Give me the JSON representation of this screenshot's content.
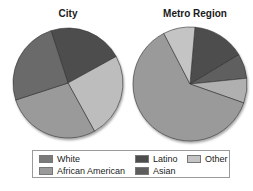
{
  "chart_data": [
    {
      "type": "pie",
      "title": "City",
      "categories": [
        "Latino",
        "Other",
        "African American",
        "White"
      ],
      "values": [
        22,
        25,
        28,
        25
      ],
      "colors": [
        "#4d4d4d",
        "#bdbdbd",
        "#9a9a9a",
        "#6a6a6a"
      ]
    },
    {
      "type": "pie",
      "title": "Metro Region",
      "categories": [
        "Latino",
        "Asian",
        "African American",
        "White",
        "Other"
      ],
      "values": [
        15,
        7,
        7,
        62,
        9
      ],
      "colors": [
        "#4d4d4d",
        "#5e5e5e",
        "#b0b0b0",
        "#9a9a9a",
        "#c4c4c4"
      ]
    }
  ],
  "titles": {
    "city": "City",
    "metro": "Metro Region"
  },
  "legend": {
    "position": "bottom",
    "items": [
      {
        "label": "White",
        "color": "#7a7a7a"
      },
      {
        "label": "African American",
        "color": "#9a9a9a"
      },
      {
        "label": "Latino",
        "color": "#4d4d4d"
      },
      {
        "label": "Asian",
        "color": "#5e5e5e"
      },
      {
        "label": "Other",
        "color": "#c4c4c4"
      }
    ]
  }
}
